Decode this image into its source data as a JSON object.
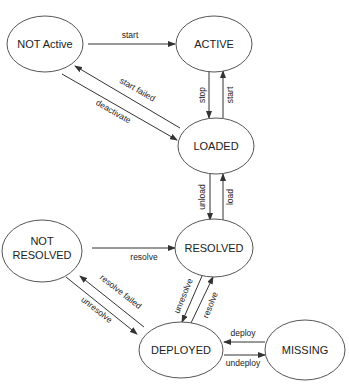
{
  "diagram": {
    "type": "state-machine",
    "states": [
      {
        "id": "not_active",
        "label": "NOT Active"
      },
      {
        "id": "active",
        "label": "ACTIVE"
      },
      {
        "id": "loaded",
        "label": "LOADED"
      },
      {
        "id": "not_resolved",
        "label_line1": "NOT",
        "label_line2": "RESOLVED"
      },
      {
        "id": "resolved",
        "label": "RESOLVED"
      },
      {
        "id": "deployed",
        "label": "DEPLOYED"
      },
      {
        "id": "missing",
        "label": "MISSING"
      }
    ],
    "transitions": [
      {
        "from": "not_active",
        "to": "active",
        "label": "start"
      },
      {
        "from": "loaded",
        "to": "not_active",
        "label": "start failed"
      },
      {
        "from": "not_active",
        "to": "loaded",
        "label": "deactivate"
      },
      {
        "from": "active",
        "to": "loaded",
        "label": "stop"
      },
      {
        "from": "loaded",
        "to": "active",
        "label": "start"
      },
      {
        "from": "loaded",
        "to": "resolved",
        "label": "unload"
      },
      {
        "from": "resolved",
        "to": "loaded",
        "label": "load"
      },
      {
        "from": "not_resolved",
        "to": "resolved",
        "label": "resolve"
      },
      {
        "from": "deployed",
        "to": "not_resolved",
        "label": "resolve failed"
      },
      {
        "from": "not_resolved",
        "to": "deployed",
        "label": "unresolve"
      },
      {
        "from": "resolved",
        "to": "deployed",
        "label": "unresolve"
      },
      {
        "from": "deployed",
        "to": "resolved",
        "label": "resolve"
      },
      {
        "from": "missing",
        "to": "deployed",
        "label": "deploy"
      },
      {
        "from": "deployed",
        "to": "missing",
        "label": "undeploy"
      }
    ]
  }
}
